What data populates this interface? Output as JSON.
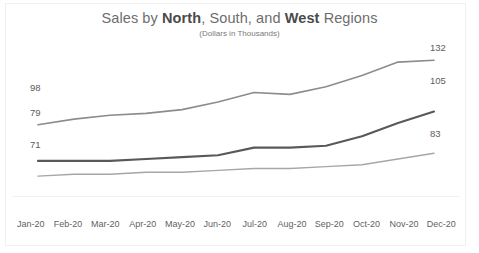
{
  "chart_data": {
    "type": "line",
    "title": "Sales by North, South, and West Regions",
    "title_parts": [
      {
        "text": "Sales by ",
        "bold": false
      },
      {
        "text": "North",
        "bold": true
      },
      {
        "text": ", South, and ",
        "bold": false
      },
      {
        "text": "West",
        "bold": true
      },
      {
        "text": " Regions",
        "bold": false
      }
    ],
    "subtitle": "(Dollars in Thousands)",
    "xlabel": "",
    "ylabel": "",
    "grid": false,
    "legend": "none",
    "axis_visible": true,
    "ylim": [
      60,
      140
    ],
    "categories": [
      "Jan-20",
      "Feb-20",
      "Mar-20",
      "Apr-20",
      "May-20",
      "Jun-20",
      "Jul-20",
      "Aug-20",
      "Sep-20",
      "Oct-20",
      "Nov-20",
      "Dec-20"
    ],
    "series": [
      {
        "name": "North",
        "color": "#8c8c8c",
        "values": [
          98,
          101,
          103,
          104,
          106,
          110,
          115,
          114,
          118,
          124,
          131,
          132
        ],
        "start_label": "98",
        "end_label": "132"
      },
      {
        "name": "South",
        "color": "#595959",
        "values": [
          79,
          79,
          79,
          80,
          81,
          82,
          86,
          86,
          87,
          92,
          99,
          105
        ],
        "start_label": "79",
        "end_label": "105"
      },
      {
        "name": "West",
        "color": "#a6a6a6",
        "values": [
          71,
          72,
          72,
          73,
          73,
          74,
          75,
          75,
          76,
          77,
          80,
          83
        ],
        "start_label": "71",
        "end_label": "83"
      }
    ],
    "end_labels": {
      "north": "132",
      "south": "105",
      "west": "83"
    },
    "start_labels": {
      "north": "98",
      "south": "79",
      "west": "71"
    }
  }
}
